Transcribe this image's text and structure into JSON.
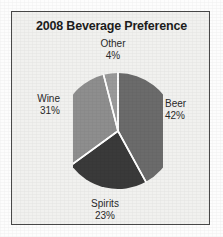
{
  "chart_data": {
    "type": "pie",
    "title": "2008 Beverage Preference",
    "xlabel": "",
    "ylabel": "",
    "legend_position": "none",
    "grid": false,
    "start_angle_deg": 0,
    "direction": "clockwise",
    "categories": [
      "Beer",
      "Spirits",
      "Wine",
      "Other"
    ],
    "values": [
      42,
      23,
      31,
      4
    ],
    "units": "percent",
    "slices": [
      {
        "label": "Beer",
        "value": 42,
        "value_text": "42%",
        "color": "#6b6b6b"
      },
      {
        "label": "Spirits",
        "value": 23,
        "value_text": "23%",
        "color": "#3a3a3a"
      },
      {
        "label": "Wine",
        "value": 31,
        "value_text": "31%",
        "color": "#8e8e8e"
      },
      {
        "label": "Other",
        "value": 4,
        "value_text": "4%",
        "color": "#9a9a9a"
      }
    ]
  },
  "figure": {
    "title": "2008 Beverage Preference",
    "background_color": "#f1f1ef",
    "frame_color": "#4a4a4a",
    "separator_color": "#ffffff"
  },
  "labels": {
    "other": {
      "name": "Other",
      "value": "4%"
    },
    "beer": {
      "name": "Beer",
      "value": "42%"
    },
    "wine": {
      "name": "Wine",
      "value": "31%"
    },
    "spirits": {
      "name": "Spirits",
      "value": "23%"
    }
  }
}
